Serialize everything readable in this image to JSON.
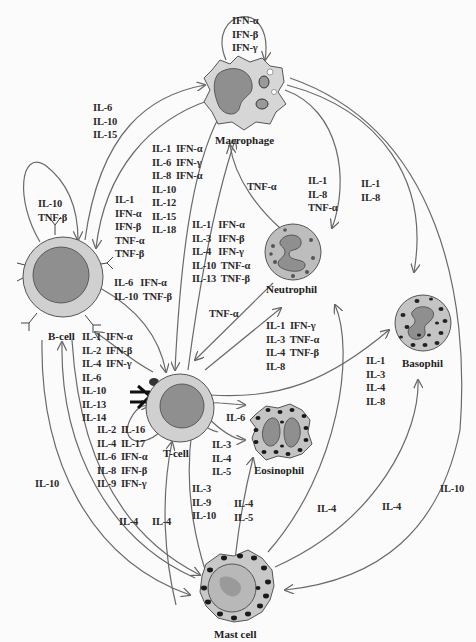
{
  "cells": {
    "macrophage": "Macrophage",
    "b_cell": "B-cell",
    "t_cell": "T-cell",
    "neutrophil": "Neutrophil",
    "basophil": "Basophil",
    "eosinophil": "Eosinophil",
    "mast_cell": "Mast cell"
  },
  "labels": {
    "macrophage_self": "IFN-α\nIFN-β\nIFN-γ",
    "bcell_to_macrophage": "IL-6\nIL-10\nIL-15",
    "macrophage_to_tcell": "IL-1  IFN-α\nIL-6  IFN-γ\nIL-8  IFN-α\nIL-10\nIL-12\nIL-15\nIL-18",
    "bcell_self": "IL-10\nTNF-β",
    "macrophage_to_bcell": "IL-1\nIFN-α\nIFN-β\nTNF-α\nTNF-β",
    "tcell_to_macrophage": "IL-1   IFN-α\nIL-3   IFN-β\nIL-4   IFN-γ\nIL-10  TNF-α\nIL-13  TNF-β",
    "neutrophil_to_macrophage": "TNF-α",
    "macrophage_to_neutrophil": "IL-1\nIL-8\nTNF-α",
    "macrophage_to_basophil": "IL-1\nIL-8",
    "bcell_to_tcell": "IL-6   IFN-α\nIL-10  TNF-β",
    "neutrophil_to_tcell": "TNF-α",
    "tcell_to_neutrophil": "IL-1  IFN-γ\nIL-3  TNF-α\nIL-4  TNF-β\nIL-8",
    "tcell_to_bcell": "IL-1  IFN-α\nIL-2  IFN-β\nIL-4  IFN-γ\nIL-6\nIL-10\nIL-13\nIL-14",
    "tcell_self": "IL-2  IL-16\nIL-4  IL-17\nIL-6  IFN-α\nIL-8  IFN-β\nIL-9  IFN-γ",
    "tcell_to_basophil": "IL-1\nIL-3\nIL-4\nIL-8",
    "eosinophil_self": "IL-6",
    "tcell_to_eosinophil": "IL-3\nIL-4\nIL-5",
    "tcell_to_mast": "IL-3\nIL-9\nIL-10",
    "mast_to_eosinophil": "IL-4\nIL-5",
    "mast_to_neutrophil": "IL-4",
    "mast_to_basophil": "IL-4",
    "macrophage_to_mast": "IL-10",
    "bcell_to_mast": "IL-10",
    "mast_to_bcell": "IL-4",
    "mast_to_tcell": "IL-4"
  },
  "colors": {
    "line": "#666666",
    "cytoplasm": "#cfcfcf",
    "nucleus": "#8f8f8f",
    "granule": "#333333",
    "outline": "#555555"
  }
}
